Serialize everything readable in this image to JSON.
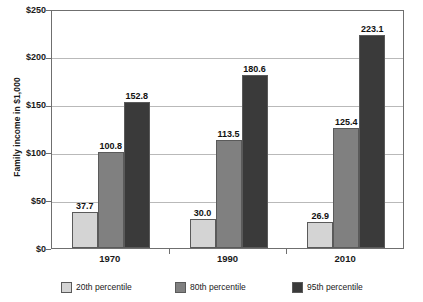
{
  "chart_data": {
    "type": "bar",
    "title": "",
    "subtitle": "",
    "xlabel": "",
    "ylabel": "Family income in $1,000",
    "categories": [
      "1970",
      "1990",
      "2010"
    ],
    "series": [
      {
        "name": "20th percentile",
        "color": "#d4d4d4",
        "values": [
          37.7,
          30.0,
          26.9
        ],
        "labels": [
          "37.7",
          "30.0",
          "26.9"
        ]
      },
      {
        "name": "80th percentile",
        "color": "#808080",
        "values": [
          100.8,
          113.5,
          125.4
        ],
        "labels": [
          "100.8",
          "113.5",
          "125.4"
        ]
      },
      {
        "name": "95th percentile",
        "color": "#3a3a3a",
        "values": [
          152.8,
          180.6,
          223.1
        ],
        "labels": [
          "152.8",
          "180.6",
          "223.1"
        ]
      }
    ],
    "ylim": [
      0,
      250
    ],
    "yticks": [
      0,
      50,
      100,
      150,
      200,
      250
    ],
    "ytick_labels": [
      "$0",
      "$50",
      "$100",
      "$150",
      "$200",
      "$250"
    ],
    "grid": "horizontal",
    "legend_position": "bottom",
    "value_labels_shown": true
  },
  "legend": {
    "items": [
      {
        "label": "20th percentile",
        "color": "#d4d4d4"
      },
      {
        "label": "80th percentile",
        "color": "#808080"
      },
      {
        "label": "95th percentile",
        "color": "#3a3a3a"
      }
    ]
  },
  "colors": {
    "axis": "#6f6f6f",
    "gridline": "#b9b9b9",
    "bar_outline": "#5a5a5a",
    "text": "#1a1a1a",
    "background": "#ffffff"
  }
}
